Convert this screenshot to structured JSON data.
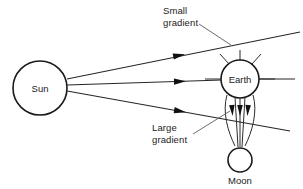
{
  "figure": {
    "background_color": "#ffffff",
    "line_color": "#262626",
    "text_color": "#222222",
    "width": 303,
    "height": 189
  },
  "bodies": {
    "sun": {
      "label": "Sun",
      "cx": 40,
      "cy": 88,
      "r": 27
    },
    "earth": {
      "label": "Earth",
      "cx": 240,
      "cy": 79,
      "r": 19
    },
    "moon": {
      "label": "Moon",
      "cx": 240,
      "cy": 160,
      "r": 12
    }
  },
  "annotations": {
    "small_gradient": {
      "line1": "Small",
      "line2": "gradient",
      "text_x": 163,
      "text_y": 14
    },
    "large_gradient": {
      "line1": "Large",
      "line2": "gradient",
      "text_x": 152,
      "text_y": 131
    }
  },
  "rays": {
    "count": 3,
    "description": "Three straight rays emanate from the Sun toward the Earth-Moon system, each carrying a filled arrowhead at its midpoint.",
    "arrowhead_count": 3
  },
  "field_arrows": {
    "count": 3,
    "description": "Three short downward filled arrows beneath the Earth indicating the large gradient region toward the Moon."
  }
}
